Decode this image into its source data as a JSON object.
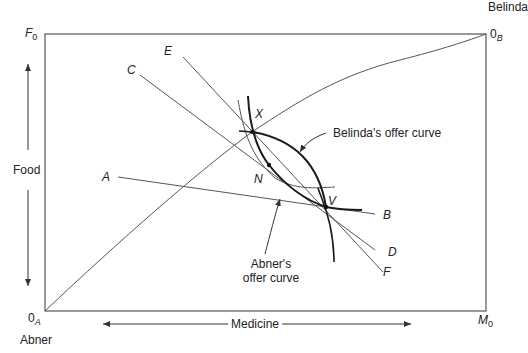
{
  "diagram": {
    "type": "edgeworth-box",
    "box": {
      "origin_a": "0",
      "origin_a_sub": "A",
      "origin_b": "0",
      "origin_b_sub": "B",
      "top_left": "F",
      "top_left_sub": "0",
      "bottom_right": "M",
      "bottom_right_sub": "0"
    },
    "agents": {
      "bottom_left": "Abner",
      "top_right": "Belinda"
    },
    "axes": {
      "vertical": "Food",
      "horizontal": "Medicine"
    },
    "price_lines": [
      {
        "start": "A",
        "end": "B"
      },
      {
        "start": "C",
        "end": "D"
      },
      {
        "start": "E",
        "end": "F"
      }
    ],
    "points": {
      "x": "X",
      "n": "N",
      "v": "V"
    },
    "annotations": {
      "belinda_curve": "Belinda's offer curve",
      "abner_curve_line1": "Abner's",
      "abner_curve_line2": "offer curve"
    },
    "colors": {
      "line": "#555555",
      "curve": "#1a1a1a",
      "text": "#222222"
    }
  }
}
